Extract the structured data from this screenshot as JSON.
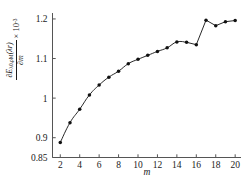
{
  "chart_data": {
    "type": "line",
    "title": "",
    "subtitle": "",
    "xlabel": "m",
    "ylabel_numerator": "∂E",
    "ylabel_numerator_sub": "λ0,ρM",
    "ylabel_numerator_arg": "(λr)",
    "ylabel_denominator": "∂m",
    "ylabel_multiplier": "× 10",
    "ylabel_multiplier_exp": "-3",
    "x": [
      2,
      3,
      4,
      5,
      6,
      7,
      8,
      9,
      10,
      11,
      12,
      13,
      14,
      15,
      16,
      17,
      18,
      19,
      20
    ],
    "values": [
      0.888,
      0.938,
      0.972,
      1.008,
      1.033,
      1.053,
      1.068,
      1.087,
      1.098,
      1.108,
      1.118,
      1.127,
      1.142,
      1.141,
      1.135,
      1.197,
      1.183,
      1.193,
      1.196
    ],
    "series": [
      {
        "name": "dE/dm",
        "values": [
          0.888,
          0.938,
          0.972,
          1.008,
          1.033,
          1.053,
          1.068,
          1.087,
          1.098,
          1.108,
          1.118,
          1.127,
          1.142,
          1.141,
          1.135,
          1.197,
          1.183,
          1.193,
          1.196
        ]
      }
    ],
    "xlim": [
      1.2,
      20.6
    ],
    "ylim": [
      0.85,
      1.215
    ],
    "xticks": [
      2,
      4,
      6,
      8,
      10,
      12,
      14,
      16,
      18,
      20
    ],
    "xtick_labels": [
      "2",
      "4",
      "6",
      "8",
      "10",
      "12",
      "14",
      "16",
      "18",
      "20"
    ],
    "yticks": [
      0.85,
      0.9,
      1.0,
      1.1,
      1.2
    ],
    "ytick_labels": [
      "0.85",
      "0.9",
      "1",
      "1.1",
      "1.2"
    ],
    "grid": false,
    "legend": false,
    "legend_position": "none",
    "marker": "filled-circle",
    "line_color": "#111111",
    "marker_color": "#111111",
    "axis_color": "#555555",
    "background_color": "#ffffff"
  }
}
